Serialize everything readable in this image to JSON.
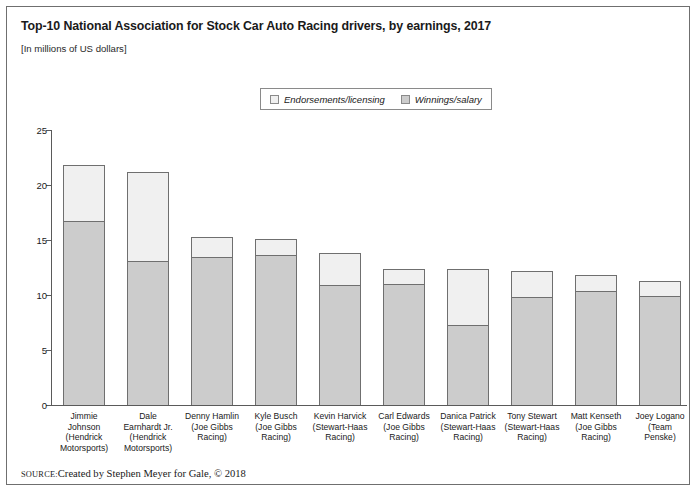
{
  "figure": {
    "title": "Top-10 National Association for Stock Car Auto Racing drivers, by earnings, 2017",
    "subtitle": "[In millions of US dollars]",
    "source_keyword": "SOURCE:",
    "source_text": "Created by Stephen Meyer for Gale, © 2018"
  },
  "colors": {
    "endorsements": "#f0f0f0",
    "winnings": "#cccccc",
    "outline": "#6f6f6f",
    "axis": "#5a5a5a",
    "text": "#1a1a1a"
  },
  "chart_data": {
    "type": "bar",
    "title": "Top-10 National Association for Stock Car Auto Racing drivers, by earnings, 2017",
    "subtitle": "[In millions of US dollars]",
    "xlabel": "",
    "ylabel": "",
    "ylim": [
      0,
      25
    ],
    "yticks": [
      0,
      5,
      10,
      15,
      20,
      25
    ],
    "ytick_labels": [
      "0",
      "5",
      "10",
      "15",
      "20",
      "25"
    ],
    "grid": false,
    "stacked": true,
    "legend_position": "top-center",
    "categories": [
      "Jimmie Johnson (Hendrick Motorsports)",
      "Dale Earnhardt Jr. (Hendrick Motorsports)",
      "Denny Hamlin (Joe Gibbs Racing)",
      "Kyle Busch (Joe Gibbs Racing)",
      "Kevin Harvick (Stewart-Haas Racing)",
      "Carl Edwards (Joe Gibbs Racing)",
      "Danica Patrick (Stewart-Haas Racing)",
      "Tony Stewart (Stewart-Haas Racing)",
      "Matt Kenseth (Joe Gibbs Racing)",
      "Joey Logano (Team Penske)"
    ],
    "category_lines": [
      [
        "Jimmie",
        "Johnson",
        "(Hendrick",
        "Motorsports)"
      ],
      [
        "Dale",
        "Earnhardt Jr.",
        "(Hendrick",
        "Motorsports)"
      ],
      [
        "Denny Hamlin",
        "(Joe Gibbs",
        "Racing)"
      ],
      [
        "Kyle Busch",
        "(Joe Gibbs",
        "Racing)"
      ],
      [
        "Kevin Harvick",
        "(Stewart-Haas",
        "Racing)"
      ],
      [
        "Carl Edwards",
        "(Joe Gibbs",
        "Racing)"
      ],
      [
        "Danica Patrick",
        "(Stewart-Haas",
        "Racing)"
      ],
      [
        "Tony Stewart",
        "(Stewart-Haas",
        "Racing)"
      ],
      [
        "Matt Kenseth",
        "(Joe Gibbs",
        "Racing)"
      ],
      [
        "Joey Logano",
        "(Team",
        "Penske)"
      ]
    ],
    "series": [
      {
        "name": "Winnings/salary",
        "color": "#cccccc",
        "values": [
          16.7,
          13.1,
          13.5,
          13.6,
          10.9,
          11.0,
          7.3,
          9.8,
          10.4,
          9.9
        ]
      },
      {
        "name": "Endorsements/licensing",
        "color": "#f0f0f0",
        "values": [
          5.1,
          8.1,
          1.8,
          1.5,
          2.9,
          1.4,
          5.1,
          2.4,
          1.4,
          1.4
        ]
      }
    ],
    "totals": [
      21.8,
      21.2,
      15.3,
      15.1,
      13.8,
      12.4,
      12.4,
      12.2,
      11.8,
      11.3
    ]
  },
  "legend": {
    "items": [
      {
        "label": "Endorsements/licensing",
        "key": "endorsements"
      },
      {
        "label": "Winnings/salary",
        "key": "winnings"
      }
    ]
  }
}
